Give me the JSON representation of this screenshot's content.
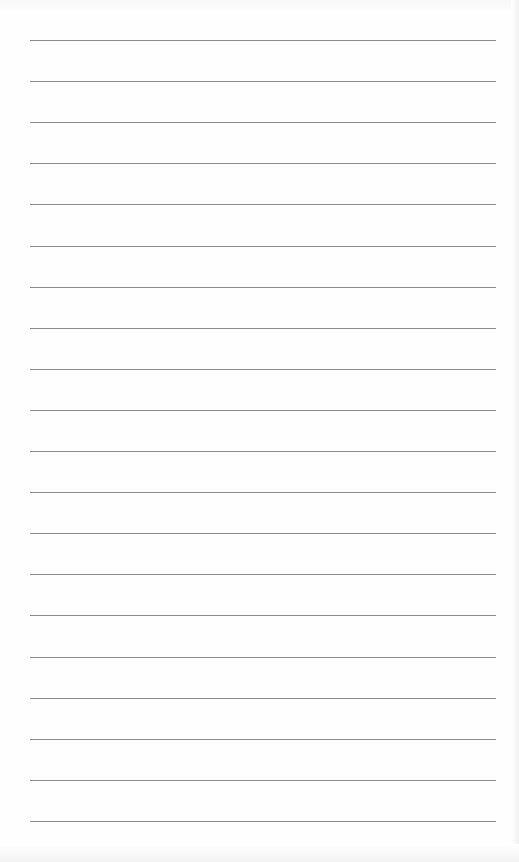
{
  "page": {
    "type": "lined-paper",
    "line_count": 20,
    "first_line_y": 40,
    "line_spacing": 41.1,
    "line_left": 30,
    "line_width": 466,
    "line_color": "#8a8a8a",
    "background_color": "#fefefe"
  }
}
